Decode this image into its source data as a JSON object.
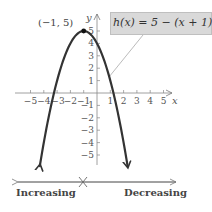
{
  "chart_data": {
    "type": "line",
    "title": "",
    "function": "h(x) = 5 - (x + 1)^2",
    "equation_label": {
      "prefix": "h(x) = 5 − (x + 1)",
      "exponent": "2"
    },
    "vertex": {
      "x": -1,
      "y": 5,
      "label": "(−1, 5)"
    },
    "x": [
      -4.3,
      -4,
      -3.5,
      -3,
      -2.5,
      -2,
      -1.5,
      -1,
      -0.5,
      0,
      0.5,
      1,
      1.5,
      2,
      2.3
    ],
    "y": [
      -5.89,
      -4,
      -1.25,
      1,
      2.75,
      4,
      4.75,
      5,
      4.75,
      4,
      2.75,
      1,
      -1.25,
      -4,
      -5.89
    ],
    "xlabel": "x",
    "ylabel": "y",
    "xlim": [
      -6,
      6
    ],
    "ylim": [
      -7,
      6
    ],
    "x_ticks": [
      "−5",
      "−4",
      "−3",
      "−2",
      "−1",
      "1",
      "2",
      "3",
      "4",
      "5"
    ],
    "y_ticks": [
      "5",
      "4",
      "3",
      "2",
      "1",
      "−1",
      "−2",
      "−3",
      "−4",
      "−5"
    ],
    "grid": false,
    "monotonicity": {
      "left_label": "Increasing",
      "right_label": "Decreasing",
      "turning_point_x": -1
    }
  },
  "labels": {
    "x_axis": "x",
    "y_axis": "y",
    "vertex": "(−1, 5)",
    "increasing": "Increasing",
    "decreasing": "Decreasing",
    "eq_main": "h(x) = 5 − (x + 1)",
    "eq_exp": "2"
  }
}
